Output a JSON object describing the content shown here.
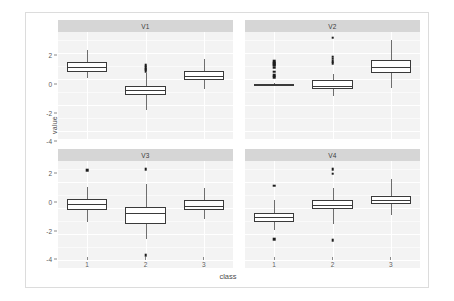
{
  "chart_data": {
    "type": "box",
    "title": "",
    "xlabel": "class",
    "ylabel": "value",
    "categories": [
      "1",
      "2",
      "3"
    ],
    "ylim": [
      -4.6,
      3.6
    ],
    "yticks": [
      2,
      0,
      -2,
      -4
    ],
    "ytick_labels": [
      "2",
      "0",
      "-2",
      "-4"
    ],
    "grid": true,
    "legend": "none",
    "facet_labels": [
      "V1",
      "V2",
      "V3",
      "V4"
    ],
    "facets": [
      {
        "name": "V1",
        "boxes": [
          {
            "class": "1",
            "min": 0.05,
            "q1": 0.55,
            "median": 0.92,
            "q3": 1.32,
            "max": 2.2,
            "outliers": []
          },
          {
            "class": "2",
            "min": -2.35,
            "q1": -1.25,
            "median": -0.88,
            "q3": -0.55,
            "max": 0.45,
            "outliers": [
              1.05,
              0.92,
              0.8,
              0.7,
              0.6
            ]
          },
          {
            "class": "3",
            "min": -0.8,
            "q1": -0.05,
            "median": 0.22,
            "q3": 0.58,
            "max": 1.55,
            "outliers": []
          }
        ]
      },
      {
        "name": "V2",
        "boxes": [
          {
            "class": "1",
            "min": -0.46,
            "q1": -0.42,
            "median": -0.4,
            "q3": -0.38,
            "max": -0.34,
            "outliers": [
              1.35,
              1.25,
              1.15,
              1.05,
              0.85,
              0.55,
              0.3,
              0.12
            ]
          },
          {
            "class": "2",
            "min": -1.3,
            "q1": -0.8,
            "median": -0.5,
            "q3": -0.1,
            "max": 0.4,
            "outliers": [
              3.15,
              1.7,
              1.55,
              1.35,
              1.2
            ]
          },
          {
            "class": "3",
            "min": -0.7,
            "q1": 0.42,
            "median": 0.9,
            "q3": 1.48,
            "max": 2.95,
            "outliers": []
          }
        ]
      },
      {
        "name": "V3",
        "boxes": [
          {
            "class": "1",
            "min": -1.05,
            "q1": -0.12,
            "median": 0.28,
            "q3": 0.65,
            "max": 1.6,
            "outliers": [
              2.9
            ]
          },
          {
            "class": "2",
            "min": -2.35,
            "q1": -1.22,
            "median": -0.42,
            "q3": 0.05,
            "max": 1.8,
            "outliers": [
              2.95,
              -3.6
            ]
          },
          {
            "class": "3",
            "min": -0.85,
            "q1": -0.12,
            "median": 0.12,
            "q3": 0.62,
            "max": 1.55,
            "outliers": []
          }
        ]
      },
      {
        "name": "V4",
        "boxes": [
          {
            "class": "1",
            "min": -1.7,
            "q1": -1.05,
            "median": -0.72,
            "q3": -0.42,
            "max": 0.6,
            "outliers": [
              1.72,
              -2.38
            ]
          },
          {
            "class": "2",
            "min": -1.22,
            "q1": -0.05,
            "median": 0.22,
            "q3": 0.6,
            "max": 1.55,
            "outliers": [
              2.95,
              2.62,
              -2.45
            ]
          },
          {
            "class": "3",
            "min": -0.55,
            "q1": 0.32,
            "median": 0.58,
            "q3": 0.9,
            "max": 2.25,
            "outliers": []
          }
        ]
      }
    ]
  }
}
